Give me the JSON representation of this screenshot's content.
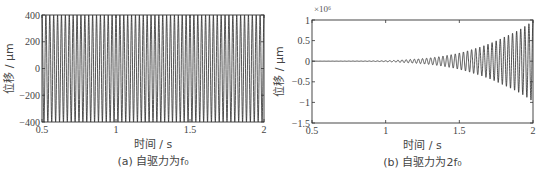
{
  "chart_data": [
    {
      "id": "a",
      "type": "line",
      "caption": "(a) 自驱力为f₀",
      "xlabel": "时间 / s",
      "ylabel": "位移 / μm",
      "xlim": [
        0.5,
        2
      ],
      "ylim": [
        -400,
        400
      ],
      "xticks": [
        0.5,
        1,
        1.5,
        2
      ],
      "xtick_labels": [
        "0.5",
        "1",
        "1.5",
        "2"
      ],
      "yticks": [
        400,
        200,
        0,
        -200,
        -400
      ],
      "ytick_labels": [
        "400",
        "200",
        "0",
        "−200",
        "−400"
      ],
      "y_multiplier": "",
      "grid": false,
      "series": [
        {
          "name": "displacement",
          "description": "Constant-amplitude sinusoid, amplitude ≈ 400 μm, ~38 Hz",
          "amplitude": 400,
          "frequency_hz": 38,
          "envelope": {
            "t": [
              0.5,
              2.0
            ],
            "amp": [
              400,
              400
            ]
          }
        }
      ],
      "frame_px": {
        "left": 42,
        "top": 15,
        "right": 264,
        "bottom": 122
      },
      "color": "#2a2a2a"
    },
    {
      "id": "b",
      "type": "line",
      "caption": "(b) 自驱力为2f₀",
      "xlabel": "时间 / s",
      "ylabel": "位移 / μm",
      "xlim": [
        0.5,
        2
      ],
      "ylim": [
        -1.5,
        1
      ],
      "xticks": [
        0.5,
        1,
        1.5,
        2
      ],
      "xtick_labels": [
        "0.5",
        "1",
        "1.5",
        "2"
      ],
      "yticks": [
        1,
        0.5,
        0,
        -0.5,
        -1,
        -1.5
      ],
      "ytick_labels": [
        "1",
        "0.5",
        "0",
        "−0.5",
        "−1",
        "−1.5"
      ],
      "y_multiplier": "×10⁶",
      "grid": false,
      "series": [
        {
          "name": "displacement",
          "description": "Sinusoid with exponentially growing amplitude (×10⁶ μm), ~36 Hz",
          "frequency_hz": 36,
          "envelope": {
            "t": [
              0.5,
              0.8,
              1.0,
              1.1,
              1.2,
              1.3,
              1.4,
              1.5,
              1.6,
              1.7,
              1.8,
              1.9,
              2.0
            ],
            "amp": [
              0.0,
              0.003,
              0.01,
              0.03,
              0.05,
              0.08,
              0.13,
              0.2,
              0.3,
              0.42,
              0.58,
              0.75,
              0.98
            ]
          }
        }
      ],
      "frame_px": {
        "left": 42,
        "top": 20,
        "right": 263,
        "bottom": 123
      },
      "color": "#2a2a2a"
    }
  ]
}
